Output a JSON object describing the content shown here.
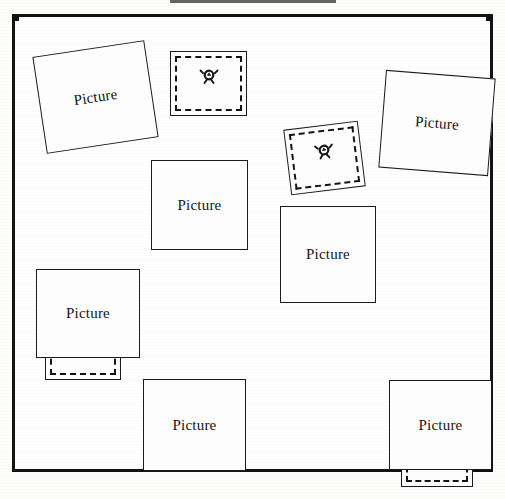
{
  "figure": {
    "caption_rule_visible": true,
    "frame": {
      "name": "figure-border",
      "stroke_color": "#121212"
    },
    "background_color": "#ffffff",
    "ink_color": "#141414"
  },
  "items": [
    {
      "id": "item-pic-1",
      "kind": "picture-placeholder",
      "label": "Picture",
      "rotation_deg": -8.5
    },
    {
      "id": "item-broken-1",
      "kind": "broken-image-placeholder",
      "icon": "broken-image-icon",
      "rotation_deg": 0
    },
    {
      "id": "item-broken-2",
      "kind": "broken-image-placeholder",
      "icon": "broken-image-icon",
      "rotation_deg": -7
    },
    {
      "id": "item-pic-2",
      "kind": "picture-placeholder",
      "label": "Picture",
      "rotation_deg": 4.5
    },
    {
      "id": "item-broken-3",
      "kind": "broken-image-placeholder",
      "icon": "broken-image-icon",
      "rotation_deg": 0
    },
    {
      "id": "item-pic-3",
      "kind": "picture-placeholder",
      "label": "Picture",
      "rotation_deg": 0
    },
    {
      "id": "item-pic-4",
      "kind": "picture-placeholder",
      "label": "Picture",
      "rotation_deg": 0
    },
    {
      "id": "item-broken-4",
      "kind": "broken-image-placeholder",
      "icon": "broken-image-icon",
      "rotation_deg": 0
    },
    {
      "id": "item-pic-5",
      "kind": "picture-placeholder",
      "label": "Picture",
      "rotation_deg": 0
    },
    {
      "id": "item-broken-5",
      "kind": "broken-image-placeholder",
      "icon": "broken-image-icon",
      "rotation_deg": 0
    },
    {
      "id": "item-broken-6",
      "kind": "broken-image-placeholder",
      "icon": "broken-image-icon",
      "rotation_deg": -5.5
    },
    {
      "id": "item-pic-6",
      "kind": "picture-placeholder",
      "label": "Picture",
      "rotation_deg": 0
    },
    {
      "id": "item-broken-7",
      "kind": "broken-image-placeholder",
      "icon": "broken-image-icon",
      "rotation_deg": 0
    },
    {
      "id": "item-pic-7",
      "kind": "picture-placeholder",
      "label": "Picture",
      "rotation_deg": 0
    }
  ]
}
